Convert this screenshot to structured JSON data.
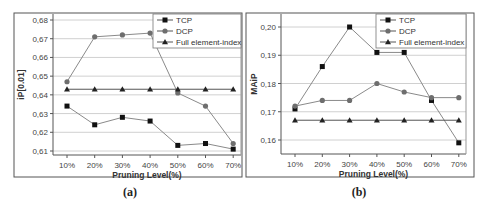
{
  "chart_data": [
    {
      "type": "line",
      "caption": "(a)",
      "title": "",
      "xlabel": "Pruning Level(%)",
      "ylabel": "iP[0.01]",
      "categories": [
        "10%",
        "20%",
        "30%",
        "40%",
        "50%",
        "60%",
        "70%"
      ],
      "yticks": [
        "0,61",
        "0,62",
        "0,63",
        "0,64",
        "0,65",
        "0,66",
        "0,67",
        "0,68"
      ],
      "ytick_values": [
        0.61,
        0.62,
        0.63,
        0.64,
        0.65,
        0.66,
        0.67,
        0.68
      ],
      "ylim": [
        0.608,
        0.681
      ],
      "grid": true,
      "legend_position": "top-right",
      "series": [
        {
          "name": "TCP",
          "marker": "square",
          "values": [
            0.634,
            0.624,
            0.628,
            0.626,
            0.613,
            0.614,
            0.611
          ]
        },
        {
          "name": "DCP",
          "marker": "circle",
          "values": [
            0.647,
            0.671,
            0.672,
            0.673,
            0.641,
            0.634,
            0.614
          ]
        },
        {
          "name": "Full element-index",
          "marker": "triangle",
          "values": [
            0.643,
            0.643,
            0.643,
            0.643,
            0.643,
            0.643,
            0.643
          ]
        }
      ]
    },
    {
      "type": "line",
      "caption": "(b)",
      "title": "",
      "xlabel": "Pruning Level(%)",
      "ylabel": "MAiP",
      "categories": [
        "10%",
        "20%",
        "30%",
        "40%",
        "50%",
        "60%",
        "70%"
      ],
      "yticks": [
        "0,16",
        "0,17",
        "0,18",
        "0,19",
        "0,20"
      ],
      "ytick_values": [
        0.16,
        0.17,
        0.18,
        0.19,
        0.2
      ],
      "ylim": [
        0.1555,
        0.2045
      ],
      "grid": true,
      "legend_position": "top-right",
      "series": [
        {
          "name": "TCP",
          "marker": "square",
          "values": [
            0.171,
            0.186,
            0.2,
            0.191,
            0.191,
            0.174,
            0.159
          ]
        },
        {
          "name": "DCP",
          "marker": "circle",
          "values": [
            0.172,
            0.174,
            0.174,
            0.18,
            0.177,
            0.175,
            0.175
          ]
        },
        {
          "name": "Full element-index",
          "marker": "triangle",
          "values": [
            0.167,
            0.167,
            0.167,
            0.167,
            0.167,
            0.167,
            0.167
          ]
        }
      ]
    }
  ],
  "style": {
    "line_color": "#8a8a8a",
    "tcp_marker": "#111111",
    "dcp_marker": "#6e6e6e",
    "full_marker": "#222222",
    "grid_color": "#d0d0d0",
    "frame_color": "#555555"
  }
}
